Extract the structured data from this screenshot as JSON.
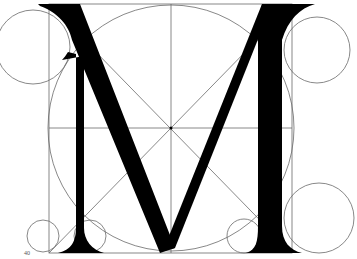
{
  "figure": {
    "letter": "M",
    "page_number": "40",
    "colors": {
      "ink": "#000000",
      "line": "#6a6a6a",
      "paper": "#ffffff"
    },
    "construction": {
      "frame": {
        "x": 49,
        "y": 4,
        "w": 243,
        "h": 249
      },
      "center": {
        "x": 171,
        "y": 128
      },
      "main_circle_r": 122,
      "circles": [
        {
          "name": "top-left",
          "cx": 33,
          "cy": 47,
          "r": 37
        },
        {
          "name": "top-right",
          "cx": 317,
          "cy": 50,
          "r": 33
        },
        {
          "name": "bottom-right",
          "cx": 319,
          "cy": 218,
          "r": 35
        },
        {
          "name": "bottom-left-outer",
          "cx": 43,
          "cy": 236,
          "r": 16
        },
        {
          "name": "bottom-left-inner",
          "cx": 90,
          "cy": 236,
          "r": 16
        },
        {
          "name": "bottom-center-right",
          "cx": 244,
          "cy": 236,
          "r": 17
        }
      ]
    }
  }
}
